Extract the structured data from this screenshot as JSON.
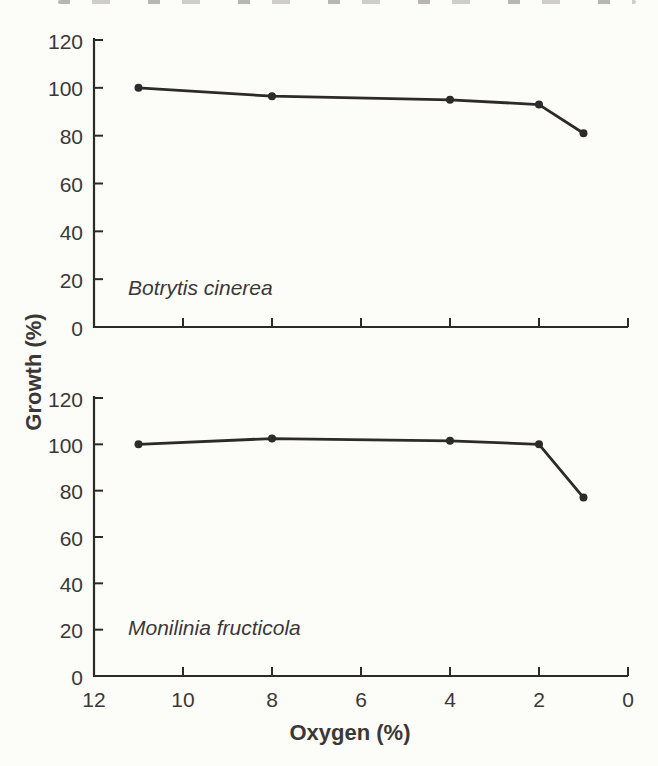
{
  "figure": {
    "shared_ylabel": "Growth (%)",
    "shared_xlabel": "Oxygen (%)",
    "line_color": "#2d2b29",
    "text_color": "#3a3836",
    "background": "#fcfcf9"
  },
  "chart_data": [
    {
      "type": "line",
      "id": "botrytis",
      "annotation": "Botrytis cinerea",
      "xlabel": "Oxygen (%)",
      "ylabel": "Growth (%)",
      "x": [
        11,
        8,
        4,
        2,
        1
      ],
      "values": [
        100,
        96.5,
        95,
        93,
        81
      ],
      "xlim": [
        12,
        0
      ],
      "ylim": [
        0,
        120
      ],
      "xticks": [
        12,
        10,
        8,
        6,
        4,
        2,
        0
      ],
      "yticks": [
        0,
        20,
        40,
        60,
        80,
        100,
        120
      ],
      "show_x_tick_labels": false,
      "x_axis_reversed": true,
      "grid": false,
      "marker": "circle",
      "legend": "none"
    },
    {
      "type": "line",
      "id": "monilinia",
      "annotation": "Monilinia fructicola",
      "xlabel": "Oxygen (%)",
      "ylabel": "Growth (%)",
      "x": [
        11,
        8,
        4,
        2,
        1
      ],
      "values": [
        100,
        102.5,
        101.5,
        100,
        77
      ],
      "xlim": [
        12,
        0
      ],
      "ylim": [
        0,
        120
      ],
      "xticks": [
        12,
        10,
        8,
        6,
        4,
        2,
        0
      ],
      "yticks": [
        0,
        20,
        40,
        60,
        80,
        100,
        120
      ],
      "show_x_tick_labels": true,
      "x_axis_reversed": true,
      "grid": false,
      "marker": "circle",
      "legend": "none"
    }
  ]
}
